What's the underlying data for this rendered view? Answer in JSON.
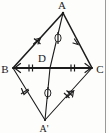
{
  "figure": {
    "background_color": "#fdfdfc",
    "line_color": "#1c1c1c",
    "margin_rule_color": "#9a9a9a"
  },
  "labels": {
    "a": "A",
    "b": "B",
    "c": "C",
    "d": "D",
    "a_prime": "A'"
  },
  "points": {
    "A": {
      "x": 63,
      "y": 13,
      "label": "A",
      "label_x": 62,
      "label_y": 8
    },
    "B": {
      "x": 13,
      "y": 68,
      "label": "B",
      "label_x": 2,
      "label_y": 72
    },
    "C": {
      "x": 92,
      "y": 68,
      "label": "C",
      "label_x": 95,
      "label_y": 72
    },
    "D": {
      "x": 50,
      "y": 68,
      "label": "D",
      "label_x": 40,
      "label_y": 61
    },
    "A'": {
      "x": 45,
      "y": 120,
      "label": "A'",
      "label_x": 39,
      "label_y": 131
    }
  },
  "segments": [
    {
      "name": "segment-AB",
      "from": "A",
      "to": "B",
      "style": "main"
    },
    {
      "name": "segment-AC",
      "from": "A",
      "to": "C",
      "style": "main"
    },
    {
      "name": "segment-BC",
      "from": "B",
      "to": "C",
      "style": "base"
    },
    {
      "name": "segment-AD",
      "from": "A",
      "to": "D",
      "style": "thin"
    },
    {
      "name": "segment-DA'",
      "from": "D",
      "to": "A'",
      "style": "thin"
    },
    {
      "name": "segment-BA'",
      "from": "B",
      "to": "A'",
      "style": "thin"
    },
    {
      "name": "segment-A'C",
      "from": "A'",
      "to": "C",
      "style": "thin"
    }
  ],
  "marks": {
    "single_tick_segments": [
      "segment-AB",
      "segment-BA'"
    ],
    "double_tick_segments": [
      "segment-BD",
      "segment-DC",
      "segment-A'C"
    ],
    "circle_mark_segments": [
      "segment-AD",
      "segment-DA'"
    ],
    "arrow_direction_segments": [
      "segment-AB toward A",
      "segment-AC toward A",
      "segment-BC toward B",
      "segment-BC toward C",
      "segment-BA' toward B",
      "segment-A'C toward C"
    ]
  }
}
